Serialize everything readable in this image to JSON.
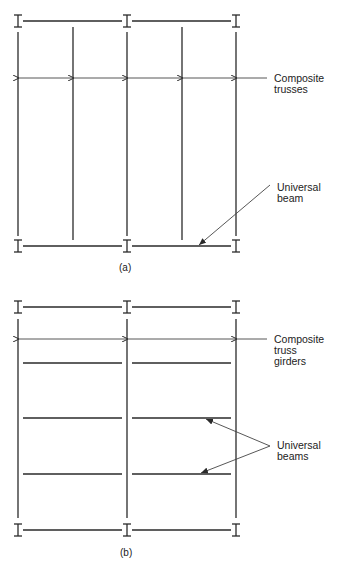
{
  "panel_a": {
    "caption": "(a)",
    "labels": {
      "trusses": "Composite\ntrusses",
      "beam": "Universal\nbeam"
    }
  },
  "panel_b": {
    "caption": "(b)",
    "labels": {
      "girders": "Composite\ntruss\ngirders",
      "beams": "Universal\nbeams"
    }
  },
  "colors": {
    "line": "#2a2a2a",
    "background": "#ffffff"
  }
}
